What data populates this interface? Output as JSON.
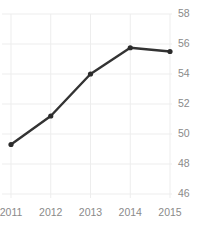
{
  "chart_data": {
    "type": "line",
    "title": "",
    "xlabel": "",
    "ylabel": "",
    "categories": [
      "2011",
      "2012",
      "2013",
      "2014",
      "2015"
    ],
    "values": [
      49.3,
      51.2,
      54.0,
      55.75,
      55.5
    ],
    "series": [
      {
        "name": "series-1",
        "values": [
          49.3,
          51.2,
          54.0,
          55.75,
          55.5
        ]
      }
    ],
    "ylim": [
      46,
      58
    ],
    "yticks": [
      58,
      56,
      54,
      52,
      50,
      48,
      46
    ],
    "ytick_labels": [
      "58",
      "56",
      "54",
      "52",
      "50",
      "48",
      "46"
    ],
    "xtick_labels": [
      "2011",
      "2012",
      "2013",
      "2014",
      "2015"
    ],
    "y_axis_position": "right",
    "grid": true,
    "grid_x": true,
    "grid_y": true,
    "legend": false,
    "legend_position": "none",
    "markers": true,
    "colors": {
      "line": "#333333",
      "marker": "#2b2b2b",
      "grid": "#ededed",
      "tick_label": "#8a8a8a",
      "background": "#ffffff"
    }
  }
}
